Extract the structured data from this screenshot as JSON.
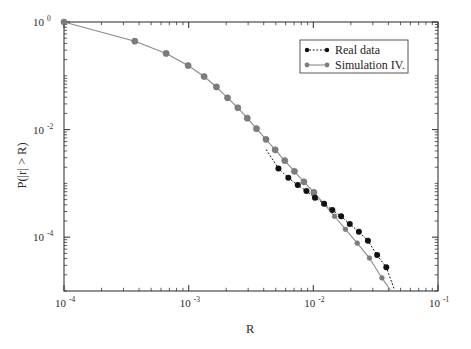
{
  "chart_data": {
    "type": "line",
    "title": "",
    "xlabel": "R",
    "ylabel": "P(|r| > R)",
    "xscale": "log",
    "yscale": "log",
    "xlim": [
      0.0001,
      0.1
    ],
    "ylim": [
      1e-05,
      1.0
    ],
    "grid": false,
    "legend_position": "top-right",
    "xticks": [
      {
        "value": 0.0001,
        "mantissa": "10",
        "exponent": "-4"
      },
      {
        "value": 0.001,
        "mantissa": "10",
        "exponent": "-3"
      },
      {
        "value": 0.01,
        "mantissa": "10",
        "exponent": "-2"
      },
      {
        "value": 0.1,
        "mantissa": "10",
        "exponent": "-1"
      }
    ],
    "yticks": [
      {
        "value": 1.0,
        "mantissa": "10",
        "exponent": "0"
      },
      {
        "value": 0.01,
        "mantissa": "10",
        "exponent": "-2"
      },
      {
        "value": 0.0001,
        "mantissa": "10",
        "exponent": "-4"
      }
    ],
    "series": [
      {
        "name": "Real data",
        "marker": "filled-circle",
        "color": "#111111",
        "linestyle": "dotted",
        "x": [
          0.00525,
          0.0063,
          0.0075,
          0.0088,
          0.0103,
          0.0122,
          0.0142,
          0.0167,
          0.0196,
          0.0232,
          0.0274,
          0.0325,
          0.0385
        ],
        "y": [
          0.0019,
          0.00127,
          0.00093,
          0.00072,
          0.00054,
          0.00042,
          0.00032,
          0.000245,
          0.000175,
          0.000126,
          8.55e-05,
          4.65e-05,
          2.75e-05
        ]
      },
      {
        "name": "Simulation IV.",
        "marker": "filled-circle",
        "color": "#7d7d7d",
        "linestyle": "solid",
        "x": [
          0.0001,
          0.00037,
          0.00066,
          0.00099,
          0.00133,
          0.00167,
          0.00205,
          0.00248,
          0.00295,
          0.0035,
          0.00417,
          0.00494,
          0.0059,
          0.00705,
          0.0084,
          0.0101,
          0.0122,
          0.0148,
          0.0181,
          0.0225,
          0.0282,
          0.0355
        ],
        "y": [
          1.0,
          0.44,
          0.26,
          0.155,
          0.097,
          0.062,
          0.039,
          0.0255,
          0.0163,
          0.0104,
          0.0066,
          0.0042,
          0.00265,
          0.00168,
          0.00107,
          0.00068,
          0.000415,
          0.000245,
          0.00014,
          7.75e-05,
          4.1e-05,
          1.75e-05
        ]
      }
    ]
  },
  "legend": {
    "entries": [
      {
        "label": "Real data",
        "color": "#111111",
        "style": "dotted"
      },
      {
        "label": "Simulation IV.",
        "color": "#8a8a8a",
        "style": "solid"
      }
    ]
  }
}
